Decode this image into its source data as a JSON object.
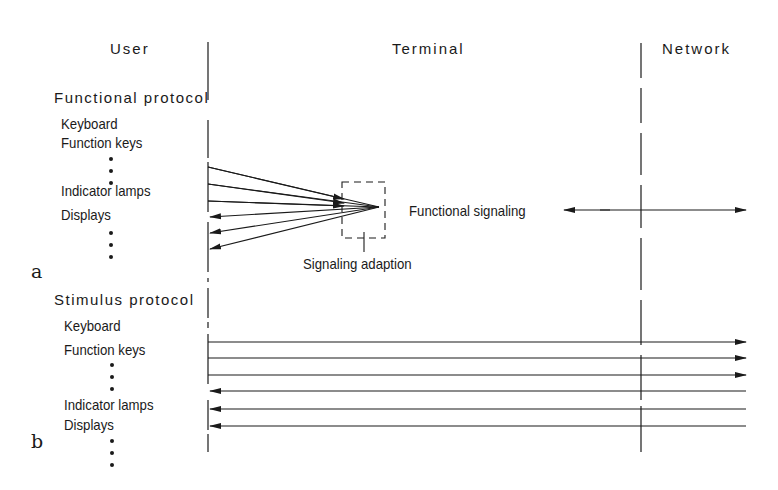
{
  "columns": {
    "user": "User",
    "terminal": "Terminal",
    "network": "Network"
  },
  "part_a": {
    "marker": "a",
    "protocol_title": "Functional protocol",
    "items": [
      "Keyboard",
      "Function keys",
      "Indicator lamps",
      "Displays"
    ],
    "box_label": "Signaling adaption",
    "signal_label": "Functional signaling",
    "inbound_lines": 3,
    "outbound_lines": 3
  },
  "part_b": {
    "marker": "b",
    "protocol_title": "Stimulus protocol",
    "items": [
      "Keyboard",
      "Function keys",
      "Indicator lamps",
      "Displays"
    ],
    "to_network_lines": 3,
    "from_network_lines": 3
  },
  "colors": {
    "ink": "#1a1a1a",
    "background": "#ffffff"
  }
}
